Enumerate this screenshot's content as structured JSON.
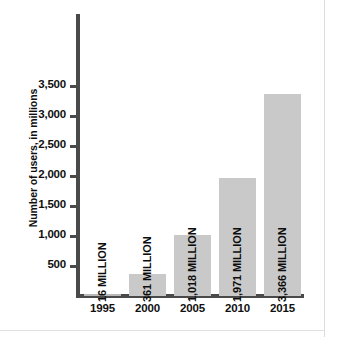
{
  "chart_data": {
    "type": "bar",
    "title": "",
    "subtitle": "",
    "xlabel": "",
    "ylabel": "Number of users, in millions",
    "categories": [
      "1995",
      "2000",
      "2005",
      "2010",
      "2015"
    ],
    "values": [
      16,
      361,
      1018,
      1971,
      3366
    ],
    "data_labels": [
      "16 MILLION",
      "361 MILLION",
      "1,018 MILLION",
      "1,971 MILLION",
      "3,366 MILLION"
    ],
    "ytick_values": [
      500,
      1000,
      1500,
      2000,
      2500,
      3000,
      3500
    ],
    "ytick_labels": [
      "500",
      "1,000",
      "1,500",
      "2,000",
      "2,500",
      "3,000",
      "3,500"
    ],
    "ylim": [
      0,
      3700
    ],
    "grid": false,
    "legend": null,
    "legend_position": "none",
    "colors": {
      "bar_fill": "#c9c9c9",
      "axis": "#4a4a4a",
      "text": "#101010",
      "background": "#ffffff",
      "page_rule": "#dcdcdc"
    }
  }
}
